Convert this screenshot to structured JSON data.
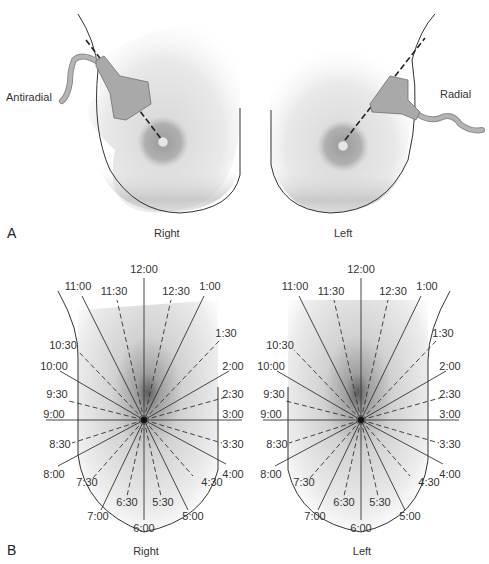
{
  "panel_a": {
    "letter": "A",
    "right": {
      "caption": "Right",
      "probe_label": "Antiradial"
    },
    "left": {
      "caption": "Left",
      "probe_label": "Radial"
    }
  },
  "panel_b": {
    "letter": "B",
    "right": {
      "caption": "Right"
    },
    "left": {
      "caption": "Left"
    },
    "clock_labels": {
      "h12": "12:00",
      "h1230": "12:30",
      "h1": "1:00",
      "h130": "1:30",
      "h2": "2:00",
      "h230": "2:30",
      "h3": "3:00",
      "h330": "3:30",
      "h4": "4:00",
      "h430": "4:30",
      "h5": "5:00",
      "h530": "5:30",
      "h6": "6:00",
      "h630": "6:30",
      "h7": "7:00",
      "h730": "7:30",
      "h8": "8:00",
      "h830": "8:30",
      "h9": "9:00",
      "h930": "9:30",
      "h10": "10:00",
      "h1030": "10:30",
      "h11": "11:00",
      "h1130": "11:30"
    }
  },
  "colors": {
    "outline": "#333333",
    "skin_light": "#f4f4f4",
    "skin_dark": "#bdbdbd",
    "areola": "#a8a8a8",
    "probe": "#a9a9a9"
  }
}
